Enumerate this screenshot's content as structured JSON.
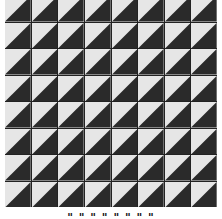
{
  "figure": {
    "pattern": "half-square-triangle-grid",
    "columns": 8,
    "rows": 8,
    "light_color": "#e6e6e6",
    "dark_color": "#2a2a2a",
    "caption": "\" \" \" \" \" \" \" \""
  }
}
